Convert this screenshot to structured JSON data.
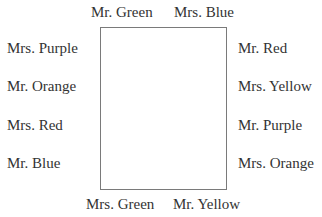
{
  "diagram": {
    "type": "seating-arrangement",
    "table": {
      "shape": "rectangle"
    },
    "top": [
      "Mr. Green",
      "Mrs. Blue"
    ],
    "bottom": [
      "Mrs. Green",
      "Mr. Yellow"
    ],
    "left": [
      "Mrs. Purple",
      "Mr. Orange",
      "Mrs. Red",
      "Mr. Blue"
    ],
    "right": [
      "Mr. Red",
      "Mrs. Yellow",
      "Mr. Purple",
      "Mrs. Orange"
    ]
  }
}
